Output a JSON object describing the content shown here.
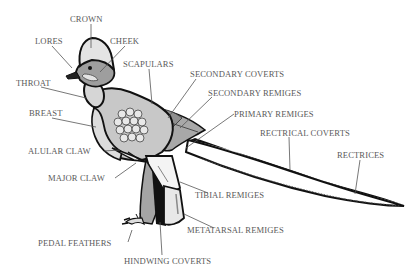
{
  "diagram": {
    "colors": {
      "outline": "#111111",
      "leader": "#555555",
      "label": "#5a5a5a",
      "light_gray": "#d6d6d6",
      "mid_gray": "#a8a8a8",
      "dark_gray": "#7e7e7e"
    },
    "labels": [
      {
        "id": "crown",
        "text": "CROWN",
        "x": 70,
        "y": 14
      },
      {
        "id": "lores",
        "text": "LORES",
        "x": 35,
        "y": 36
      },
      {
        "id": "cheek",
        "text": "CHEEK",
        "x": 110,
        "y": 36
      },
      {
        "id": "scapulars",
        "text": "SCAPULARS",
        "x": 123,
        "y": 59
      },
      {
        "id": "throat",
        "text": "THROAT",
        "x": 16,
        "y": 78
      },
      {
        "id": "secondary-coverts",
        "text": "SECONDARY COVERTS",
        "x": 190,
        "y": 69
      },
      {
        "id": "secondary-remiges",
        "text": "SECONDARY REMIGES",
        "x": 208,
        "y": 88
      },
      {
        "id": "primary-remiges",
        "text": "PRIMARY REMIGES",
        "x": 234,
        "y": 109
      },
      {
        "id": "breast",
        "text": "BREAST",
        "x": 29,
        "y": 108
      },
      {
        "id": "rectrical-coverts",
        "text": "RECTRICAL COVERTS",
        "x": 260,
        "y": 128
      },
      {
        "id": "rectrices",
        "text": "RECTRICES",
        "x": 337,
        "y": 150
      },
      {
        "id": "alular-claw",
        "text": "ALULAR CLAW",
        "x": 28,
        "y": 146
      },
      {
        "id": "major-claw",
        "text": "MAJOR CLAW",
        "x": 48,
        "y": 173
      },
      {
        "id": "tibial-remiges",
        "text": "TIBIAL REMIGES",
        "x": 195,
        "y": 190
      },
      {
        "id": "metatarsal-remiges",
        "text": "METATARSAL REMIGES",
        "x": 187,
        "y": 225
      },
      {
        "id": "pedal-feathers",
        "text": "PEDAL FEATHERS",
        "x": 38,
        "y": 238
      },
      {
        "id": "hindwing-coverts",
        "text": "HINDWING COVERTS",
        "x": 124,
        "y": 256
      }
    ]
  }
}
